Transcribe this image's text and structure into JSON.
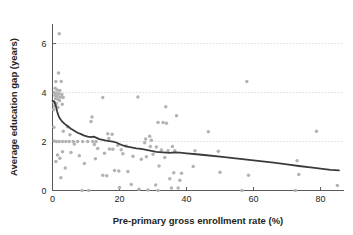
{
  "chart_data": {
    "type": "scatter",
    "title": "",
    "xlabel": "Pre-primary gross enrollment rate (%)",
    "ylabel": "Average education gap (years)",
    "xlim": [
      0,
      87
    ],
    "ylim": [
      0,
      6.8
    ],
    "xticks": [
      0,
      20,
      40,
      60,
      80
    ],
    "yticks": [
      0,
      2,
      4,
      6
    ],
    "xtick_labels": [
      "0",
      "20",
      "40",
      "60",
      "80"
    ],
    "ytick_labels": [
      "0",
      "2",
      "4",
      "6"
    ],
    "grid": "horizontal-dashed",
    "grid_values": [
      2,
      4,
      6
    ],
    "legend": "none",
    "marker_color": "#b3b3b3",
    "line_color": "#3b3b3b",
    "series": [
      {
        "name": "Countries",
        "type": "scatter",
        "points": [
          [
            2.0,
            6.4
          ],
          [
            1.8,
            4.8
          ],
          [
            1.0,
            4.45
          ],
          [
            2.6,
            4.45
          ],
          [
            0.8,
            4.18
          ],
          [
            1.4,
            4.1
          ],
          [
            2.2,
            4.08
          ],
          [
            0.5,
            4.0
          ],
          [
            1.1,
            3.97
          ],
          [
            1.9,
            3.95
          ],
          [
            2.8,
            3.92
          ],
          [
            0.7,
            3.88
          ],
          [
            1.5,
            3.85
          ],
          [
            2.4,
            3.82
          ],
          [
            3.2,
            3.8
          ],
          [
            0.9,
            3.75
          ],
          [
            1.7,
            3.72
          ],
          [
            2.1,
            3.68
          ],
          [
            0.4,
            3.6
          ],
          [
            1.2,
            3.55
          ],
          [
            2.9,
            3.52
          ],
          [
            0.6,
            3.45
          ],
          [
            1.6,
            3.4
          ],
          [
            0.3,
            3.3
          ],
          [
            15.0,
            3.8
          ],
          [
            25.5,
            3.82
          ],
          [
            33.8,
            3.42
          ],
          [
            37.0,
            3.05
          ],
          [
            11.8,
            3.0
          ],
          [
            11.5,
            2.82
          ],
          [
            31.5,
            2.78
          ],
          [
            33.0,
            2.78
          ],
          [
            34.0,
            2.75
          ],
          [
            4.5,
            2.6
          ],
          [
            0.4,
            2.58
          ],
          [
            46.5,
            2.4
          ],
          [
            78.8,
            2.42
          ],
          [
            3.2,
            2.42
          ],
          [
            58.0,
            4.45
          ],
          [
            16.5,
            2.32
          ],
          [
            17.8,
            2.3
          ],
          [
            5.2,
            2.28
          ],
          [
            29.0,
            2.22
          ],
          [
            16.8,
            2.12
          ],
          [
            27.8,
            2.1
          ],
          [
            29.5,
            2.05
          ],
          [
            0.5,
            2.02
          ],
          [
            1.2,
            2.0
          ],
          [
            2.0,
            2.0
          ],
          [
            3.0,
            2.0
          ],
          [
            4.0,
            2.0
          ],
          [
            5.0,
            2.0
          ],
          [
            6.2,
            2.0
          ],
          [
            7.5,
            2.0
          ],
          [
            9.0,
            2.0
          ],
          [
            10.5,
            2.0
          ],
          [
            12.0,
            2.0
          ],
          [
            13.0,
            2.0
          ],
          [
            27.5,
            1.95
          ],
          [
            6.5,
            1.9
          ],
          [
            12.5,
            1.88
          ],
          [
            19.5,
            1.85
          ],
          [
            22.0,
            1.82
          ],
          [
            29.2,
            1.8
          ],
          [
            35.8,
            1.8
          ],
          [
            31.0,
            1.78
          ],
          [
            13.5,
            1.72
          ],
          [
            17.0,
            1.7
          ],
          [
            18.0,
            1.68
          ],
          [
            20.5,
            1.66
          ],
          [
            32.5,
            1.65
          ],
          [
            34.5,
            1.62
          ],
          [
            36.5,
            1.62
          ],
          [
            42.5,
            1.62
          ],
          [
            49.5,
            1.6
          ],
          [
            3.0,
            1.58
          ],
          [
            5.5,
            1.55
          ],
          [
            15.5,
            1.52
          ],
          [
            21.0,
            1.5
          ],
          [
            30.0,
            1.48
          ],
          [
            1.5,
            1.45
          ],
          [
            8.0,
            1.42
          ],
          [
            24.0,
            1.4
          ],
          [
            28.0,
            1.38
          ],
          [
            33.5,
            1.35
          ],
          [
            2.2,
            1.32
          ],
          [
            12.8,
            1.3
          ],
          [
            26.5,
            1.28
          ],
          [
            73.0,
            1.22
          ],
          [
            1.0,
            1.18
          ],
          [
            9.5,
            1.1
          ],
          [
            31.8,
            1.0
          ],
          [
            42.0,
            0.98
          ],
          [
            3.8,
            0.92
          ],
          [
            18.5,
            0.82
          ],
          [
            19.8,
            0.8
          ],
          [
            22.5,
            0.78
          ],
          [
            50.0,
            0.75
          ],
          [
            36.2,
            0.72
          ],
          [
            38.5,
            0.7
          ],
          [
            15.0,
            0.62
          ],
          [
            16.2,
            0.6
          ],
          [
            58.5,
            0.62
          ],
          [
            73.5,
            0.65
          ],
          [
            2.5,
            0.52
          ],
          [
            35.0,
            0.48
          ],
          [
            38.0,
            0.42
          ],
          [
            23.5,
            0.25
          ],
          [
            30.8,
            0.22
          ],
          [
            85.0,
            0.2
          ],
          [
            20.0,
            0.12
          ],
          [
            8.8,
            0.0
          ],
          [
            10.8,
            0.0
          ],
          [
            25.8,
            0.05
          ],
          [
            28.5,
            0.02
          ],
          [
            31.5,
            0.0
          ],
          [
            35.5,
            0.1
          ],
          [
            37.5,
            0.1
          ],
          [
            56.5,
            0.0
          ],
          [
            72.5,
            0.0
          ]
        ]
      },
      {
        "name": "Smoothed trend",
        "type": "line",
        "points": [
          [
            0.0,
            3.66
          ],
          [
            0.6,
            3.62
          ],
          [
            1.0,
            3.45
          ],
          [
            1.4,
            3.22
          ],
          [
            1.8,
            3.05
          ],
          [
            2.3,
            2.92
          ],
          [
            3.0,
            2.8
          ],
          [
            3.8,
            2.7
          ],
          [
            4.6,
            2.62
          ],
          [
            5.5,
            2.52
          ],
          [
            6.5,
            2.44
          ],
          [
            7.5,
            2.36
          ],
          [
            8.5,
            2.3
          ],
          [
            9.5,
            2.24
          ],
          [
            10.5,
            2.2
          ],
          [
            11.5,
            2.18
          ],
          [
            12.3,
            2.2
          ],
          [
            13.0,
            2.16
          ],
          [
            14.0,
            2.1
          ],
          [
            15.0,
            2.07
          ],
          [
            16.0,
            2.04
          ],
          [
            17.0,
            2.02
          ],
          [
            18.0,
            2.0
          ],
          [
            19.0,
            1.96
          ],
          [
            20.0,
            1.9
          ],
          [
            21.0,
            1.84
          ],
          [
            22.0,
            1.8
          ],
          [
            23.5,
            1.76
          ],
          [
            25.0,
            1.72
          ],
          [
            26.5,
            1.7
          ],
          [
            28.0,
            1.66
          ],
          [
            29.5,
            1.62
          ],
          [
            31.0,
            1.58
          ],
          [
            33.0,
            1.56
          ],
          [
            35.0,
            1.54
          ],
          [
            36.5,
            1.56
          ],
          [
            38.0,
            1.55
          ],
          [
            40.0,
            1.52
          ],
          [
            43.0,
            1.48
          ],
          [
            46.0,
            1.44
          ],
          [
            50.0,
            1.38
          ],
          [
            54.0,
            1.32
          ],
          [
            58.0,
            1.26
          ],
          [
            62.0,
            1.2
          ],
          [
            66.0,
            1.14
          ],
          [
            70.0,
            1.07
          ],
          [
            73.5,
            1.0
          ],
          [
            77.0,
            0.94
          ],
          [
            80.0,
            0.89
          ],
          [
            83.0,
            0.84
          ],
          [
            85.5,
            0.82
          ]
        ]
      }
    ]
  },
  "axes": {
    "x_title": "Pre-primary gross enrollment rate (%)",
    "y_title": "Average education gap (years)"
  }
}
